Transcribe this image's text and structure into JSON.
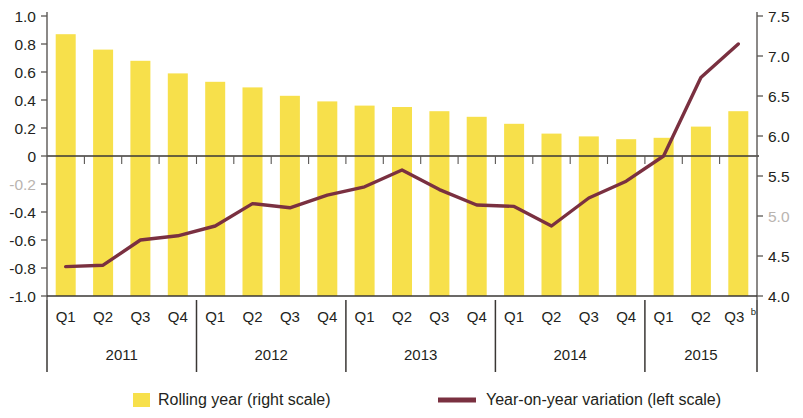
{
  "chart_data": {
    "type": "bar",
    "title": "",
    "subtitle": "",
    "xlabel": "",
    "grid": false,
    "legend_position": "bottom",
    "categories": [
      "Q1",
      "Q2",
      "Q3",
      "Q4",
      "Q1",
      "Q2",
      "Q3",
      "Q4",
      "Q1",
      "Q2",
      "Q3",
      "Q4",
      "Q1",
      "Q2",
      "Q3",
      "Q4",
      "Q1",
      "Q2",
      "Q3"
    ],
    "category_superscripts": [
      "",
      "",
      "",
      "",
      "",
      "",
      "",
      "",
      "",
      "",
      "",
      "",
      "",
      "",
      "",
      "",
      "",
      "",
      "b"
    ],
    "year_groups": [
      {
        "label": "2011",
        "start": 0,
        "count": 4
      },
      {
        "label": "2012",
        "start": 4,
        "count": 4
      },
      {
        "label": "2013",
        "start": 8,
        "count": 4
      },
      {
        "label": "2014",
        "start": 12,
        "count": 4
      },
      {
        "label": "2015",
        "start": 16,
        "count": 3
      }
    ],
    "left_axis": {
      "label": "",
      "ylim": [
        -1.0,
        1.0
      ],
      "ticks": [
        1.0,
        0.8,
        0.6,
        0.4,
        0.2,
        0,
        -0.2,
        -0.4,
        -0.6,
        -0.8,
        -1.0
      ],
      "tick_labels": [
        "1.0",
        "0.8",
        "0.6",
        "0.4",
        "0.2",
        "0",
        "-0.2",
        "-0.4",
        "-0.6",
        "-0.8",
        "-1.0"
      ],
      "faded_tick_labels": [
        "-0.2"
      ]
    },
    "right_axis": {
      "label": "",
      "ylim": [
        4.0,
        7.5
      ],
      "ticks": [
        7.5,
        7.0,
        6.5,
        6.0,
        5.5,
        5.0,
        4.5,
        4.0
      ],
      "tick_labels": [
        "7.5",
        "7.0",
        "6.5",
        "6.0",
        "5.5",
        "5.0",
        "4.5",
        "4.0"
      ],
      "faded_tick_labels": [
        "5.0"
      ]
    },
    "series": [
      {
        "name": "Rolling year (right scale)",
        "type": "bar",
        "axis": "right",
        "color": "#F7E04B",
        "values_left_scale": [
          0.87,
          0.76,
          0.68,
          0.59,
          0.53,
          0.49,
          0.43,
          0.39,
          0.36,
          0.35,
          0.32,
          0.28,
          0.23,
          0.16,
          0.14,
          0.12,
          0.13,
          0.21,
          0.32
        ],
        "values": [
          7.02,
          6.83,
          6.69,
          6.53,
          6.43,
          6.36,
          6.25,
          6.18,
          6.13,
          6.11,
          6.06,
          5.99,
          5.9,
          5.78,
          5.75,
          5.71,
          5.73,
          5.87,
          6.06
        ]
      },
      {
        "name": "Year-on-year variation (left scale)",
        "type": "line",
        "axis": "left",
        "color": "#7A3040",
        "values": [
          -0.79,
          -0.78,
          -0.6,
          -0.57,
          -0.5,
          -0.34,
          -0.37,
          -0.28,
          -0.22,
          -0.1,
          -0.24,
          -0.35,
          -0.36,
          -0.5,
          -0.3,
          -0.18,
          0.0,
          0.56,
          0.8
        ]
      }
    ]
  },
  "legend": {
    "items": [
      {
        "label": "Rolling year (right scale)",
        "marker": "swatch",
        "color": "#F7E04B"
      },
      {
        "label": "Year-on-year variation (left scale)",
        "marker": "line",
        "color": "#7A3040"
      }
    ]
  },
  "colors": {
    "bar": "#F7E04B",
    "line": "#7A3040",
    "axis": "#5a5754",
    "text": "#231f20",
    "faded_text": "#b9b4b0",
    "background": "#ffffff"
  }
}
